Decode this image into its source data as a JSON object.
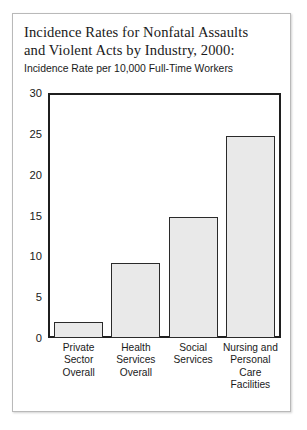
{
  "card": {
    "title_lines": [
      "Incidence Rates for Nonfatal Assaults",
      "and Violent Acts by Industry, 2000:"
    ],
    "subtitle": "Incidence Rate per 10,000 Full-Time Workers"
  },
  "chart_data": {
    "type": "bar",
    "title": "Incidence Rates for Nonfatal Assaults and Violent Acts by Industry, 2000:",
    "subtitle": "Incidence Rate per 10,000 Full-Time Workers",
    "xlabel": "",
    "ylabel": "Incidence Rate per 10,000 Full-Time Workers",
    "categories": [
      "Private Sector Overall",
      "Health Services Overall",
      "Social Services",
      "Nursing and Personal Care Facilities"
    ],
    "category_lines": [
      [
        "Private",
        "Sector",
        "Overall"
      ],
      [
        "Health",
        "Services",
        "Overall"
      ],
      [
        "Social",
        "Services"
      ],
      [
        "Nursing and",
        "Personal",
        "Care",
        "Facilities"
      ]
    ],
    "values": [
      2.0,
      9.3,
      15.0,
      25.0
    ],
    "ylim": [
      0,
      30
    ],
    "yticks": [
      0,
      5,
      10,
      15,
      20,
      25,
      30
    ],
    "ytick_labels": [
      "0",
      "5",
      "10",
      "15",
      "20",
      "25",
      "30"
    ],
    "grid": false,
    "legend": "none",
    "bar_fill_color": "#e9e9e9",
    "bar_edge_color": "#2a2a2a",
    "axis_color": "#1f1f1f"
  }
}
